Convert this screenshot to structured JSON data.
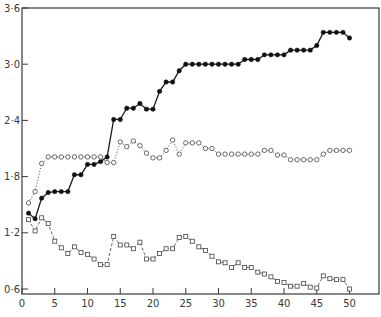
{
  "chart_data": {
    "type": "line",
    "title": "",
    "xlabel": "",
    "ylabel": "",
    "xlim": [
      0,
      55
    ],
    "ylim": [
      0.6,
      3.6
    ],
    "grid": false,
    "legend": null,
    "x_ticks": [
      0,
      5,
      10,
      15,
      20,
      25,
      30,
      35,
      40,
      45,
      50
    ],
    "x_tick_labels": [
      "0",
      "5",
      "10",
      "15",
      "20",
      "25",
      "30",
      "35",
      "40",
      "45",
      "50"
    ],
    "y_ticks": [
      0.6,
      1.2,
      1.8,
      2.4,
      3.0,
      3.6
    ],
    "y_tick_labels": [
      "0·6",
      "1·2",
      "1·8",
      "2·4",
      "3·0",
      "3·6"
    ],
    "x": [
      1,
      2,
      3,
      4,
      5,
      6,
      7,
      8,
      9,
      10,
      11,
      12,
      13,
      14,
      15,
      16,
      17,
      18,
      19,
      20,
      21,
      22,
      23,
      24,
      25,
      26,
      27,
      28,
      29,
      30,
      31,
      32,
      33,
      34,
      35,
      36,
      37,
      38,
      39,
      40,
      41,
      42,
      43,
      44,
      45,
      46,
      47,
      48,
      49,
      50
    ],
    "series": [
      {
        "name": "filled circles (solid line)",
        "marker": "filled-circle",
        "line": "solid",
        "color": "#1a1a1a",
        "values": [
          1.41,
          1.35,
          1.57,
          1.63,
          1.64,
          1.64,
          1.64,
          1.82,
          1.82,
          1.93,
          1.93,
          1.96,
          2.01,
          2.41,
          2.41,
          2.53,
          2.53,
          2.58,
          2.52,
          2.52,
          2.71,
          2.81,
          2.81,
          2.93,
          3.0,
          3.0,
          3.0,
          3.0,
          3.0,
          3.0,
          3.0,
          3.0,
          3.0,
          3.05,
          3.05,
          3.05,
          3.1,
          3.1,
          3.1,
          3.1,
          3.15,
          3.15,
          3.15,
          3.15,
          3.2,
          3.34,
          3.34,
          3.34,
          3.34,
          3.28
        ]
      },
      {
        "name": "open circles (dotted line)",
        "marker": "open-circle",
        "line": "dotted",
        "color": "#555555",
        "values": [
          1.52,
          1.64,
          1.94,
          2.01,
          2.01,
          2.01,
          2.01,
          2.01,
          2.01,
          2.01,
          2.01,
          2.01,
          1.95,
          1.95,
          2.17,
          2.12,
          2.18,
          2.13,
          2.05,
          2.0,
          2.0,
          2.08,
          2.19,
          2.04,
          2.16,
          2.16,
          2.16,
          2.1,
          2.1,
          2.04,
          2.04,
          2.04,
          2.04,
          2.04,
          2.04,
          2.04,
          2.08,
          2.08,
          2.03,
          2.03,
          1.98,
          1.98,
          1.98,
          1.98,
          1.98,
          2.04,
          2.08,
          2.08,
          2.08,
          2.08
        ]
      },
      {
        "name": "open squares (dashed line)",
        "marker": "open-square",
        "line": "dashed",
        "color": "#555555",
        "values": [
          1.34,
          1.22,
          1.36,
          1.3,
          1.11,
          1.04,
          0.98,
          1.05,
          0.99,
          0.97,
          0.92,
          0.86,
          0.86,
          1.16,
          1.07,
          1.07,
          1.03,
          1.1,
          0.92,
          0.92,
          0.98,
          1.03,
          1.03,
          1.15,
          1.16,
          1.11,
          1.05,
          1.01,
          0.95,
          0.89,
          0.88,
          0.83,
          0.88,
          0.83,
          0.83,
          0.78,
          0.76,
          0.73,
          0.68,
          0.67,
          0.63,
          0.63,
          0.66,
          0.62,
          0.61,
          0.74,
          0.71,
          0.7,
          0.7,
          0.6
        ]
      }
    ]
  }
}
